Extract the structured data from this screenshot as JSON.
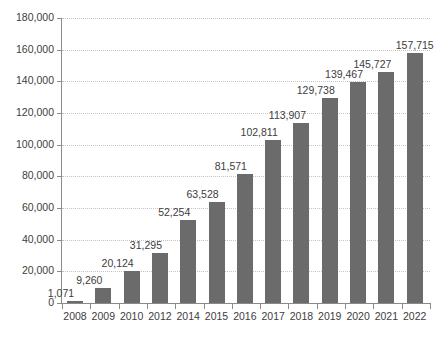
{
  "chart_data": {
    "type": "bar",
    "title": "",
    "subtitle": "",
    "xlabel": "",
    "ylabel": "",
    "categories": [
      "2008",
      "2009",
      "2010",
      "2012",
      "2014",
      "2015",
      "2016",
      "2017",
      "2018",
      "2019",
      "2020",
      "2021",
      "2022"
    ],
    "values": [
      1071,
      9260,
      20124,
      31295,
      52254,
      63528,
      81571,
      102811,
      113907,
      129738,
      139467,
      145727,
      157715
    ],
    "value_labels": [
      "1,071",
      "9,260",
      "20,124",
      "31,295",
      "52,254",
      "63,528",
      "81,571",
      "102,811",
      "113,907",
      "129,738",
      "139,467",
      "145,727",
      "157,715"
    ],
    "ylim": [
      0,
      180000
    ],
    "ytick_values": [
      0,
      20000,
      40000,
      60000,
      80000,
      100000,
      120000,
      140000,
      160000,
      180000
    ],
    "ytick_labels": [
      "0",
      "20,000",
      "40,000",
      "60,000",
      "80,000",
      "100,000",
      "120,000",
      "140,000",
      "160,000",
      "180,000"
    ],
    "grid": "horizontal-dotted",
    "legend": "none",
    "series": [
      {
        "name": "",
        "values": [
          1071,
          9260,
          20124,
          31295,
          52254,
          63528,
          81571,
          102811,
          113907,
          129738,
          139467,
          145727,
          157715
        ]
      }
    ]
  },
  "style": {
    "bar_color": "#6b6b6b",
    "grid_color": "#c4c4c4",
    "axis_color": "#8a8a8a",
    "text_color": "#3d3d3d",
    "background": "#ffffff"
  },
  "footnote": {
    "text": ""
  }
}
